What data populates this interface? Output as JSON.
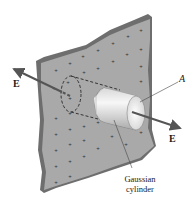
{
  "figure": {
    "labels": {
      "field_left": "E",
      "field_right": "E",
      "area": "A",
      "caption_line1": "Gaussian",
      "caption_line2": "cylinder"
    },
    "colors": {
      "sheet_face": "#a8a8a8",
      "sheet_edge": "#6e6e6e",
      "charge_mark": "#3a3a3a",
      "arrow": "#555555",
      "cylinder_light": "#f2f2f2",
      "cylinder_shade": "#b9b9b9",
      "background": "#ffffff"
    },
    "charge_symbol": "+"
  }
}
